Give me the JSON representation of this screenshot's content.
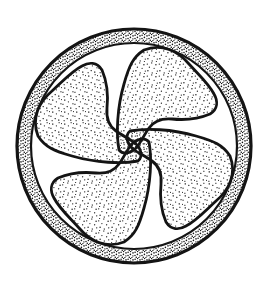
{
  "illustration": {
    "type": "stipple-ink-drawing",
    "subject": "circular emblem enclosing a four-lobed clockwise pinwheel (tetraskelion) motif",
    "background_color": "#ffffff",
    "ink_color": "#141414",
    "center_x": 134,
    "center_y": 146,
    "outer_ring_radius": 117,
    "inner_ring_radius": 103,
    "ring_band_texture": "dense stipple dots",
    "lobe_count": 4,
    "lobe_texture": "stippled dots",
    "swirl_direction": "clockwise",
    "white_gap_positions": "top, right, bottom, left",
    "lobe_positions": "top-right, bottom-right, bottom-left, top-left"
  }
}
